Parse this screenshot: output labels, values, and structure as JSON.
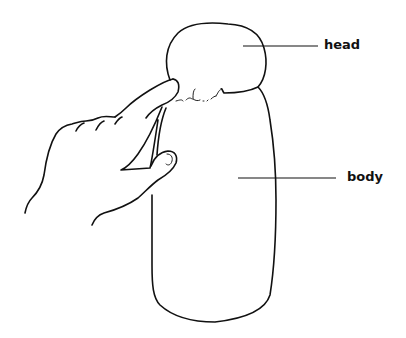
{
  "diagram": {
    "type": "labeled-illustration",
    "labels": [
      {
        "id": "head",
        "text": "head"
      },
      {
        "id": "body",
        "text": "body"
      }
    ],
    "colors": {
      "ink": "#111111",
      "background": "#ffffff"
    }
  }
}
